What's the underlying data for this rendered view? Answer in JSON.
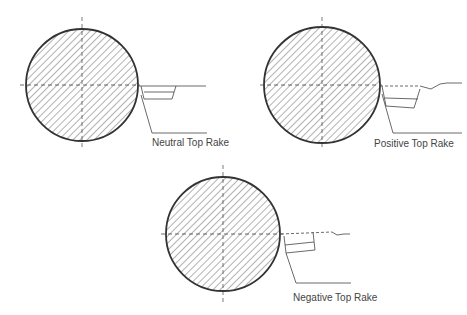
{
  "diagram": {
    "panels": [
      {
        "id": "neutral",
        "label": "Neutral Top Rake",
        "cx": 82,
        "cy": 85,
        "r": 56
      },
      {
        "id": "positive",
        "label": "Positive Top Rake",
        "cx": 322,
        "cy": 85,
        "r": 58
      },
      {
        "id": "negative",
        "label": "Negative Top Rake",
        "cx": 223,
        "cy": 234,
        "r": 57
      }
    ],
    "colors": {
      "stroke": "#333333",
      "hatch": "#555555",
      "text": "#444444",
      "background": "#ffffff"
    }
  }
}
